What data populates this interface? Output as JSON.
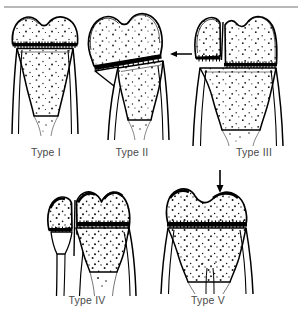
{
  "figure": {
    "background_color": "#ffffff",
    "line_color": "#000000",
    "caption_color": "#4a4a4a",
    "rule_color": "#b8b8b8"
  },
  "panels": [
    {
      "id": "type-1",
      "caption": "Type I",
      "description": "Fracture through the physis only; epiphysis separated from metaphysis",
      "has_arrow": false,
      "arrow_direction": "",
      "bone_region": "distal femur / proximal tibia growth plate"
    },
    {
      "id": "type-2",
      "caption": "Type II",
      "description": "Fracture through the physis and metaphysis with triangular metaphyseal fragment",
      "has_arrow": true,
      "arrow_direction": "left",
      "bone_region": "distal femur / proximal tibia growth plate"
    },
    {
      "id": "type-3",
      "caption": "Type III",
      "description": "Fracture through the physis and epiphysis into the joint",
      "has_arrow": false,
      "arrow_direction": "",
      "bone_region": "distal femur / proximal tibia growth plate"
    },
    {
      "id": "type-4",
      "caption": "Type IV",
      "description": "Fracture through metaphysis, physis and epiphysis",
      "has_arrow": false,
      "arrow_direction": "",
      "bone_region": "distal femur / proximal tibia growth plate"
    },
    {
      "id": "type-5",
      "caption": "Type V",
      "description": "Crush (compression) injury of the physis",
      "has_arrow": true,
      "arrow_direction": "down",
      "bone_region": "distal femur / proximal tibia growth plate"
    }
  ]
}
